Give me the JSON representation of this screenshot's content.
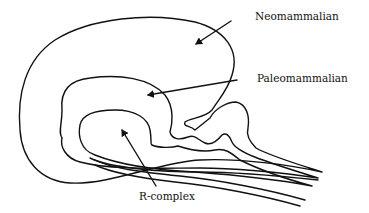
{
  "diagram": {
    "type": "triune-brain",
    "labels": [
      {
        "id": "neomammalian",
        "text": "Neomammalian"
      },
      {
        "id": "paleomammalian",
        "text": "Paleomammalian"
      },
      {
        "id": "r-complex",
        "text": "R-complex"
      }
    ],
    "colors": {
      "line": "#111111",
      "background": "#ffffff"
    }
  }
}
